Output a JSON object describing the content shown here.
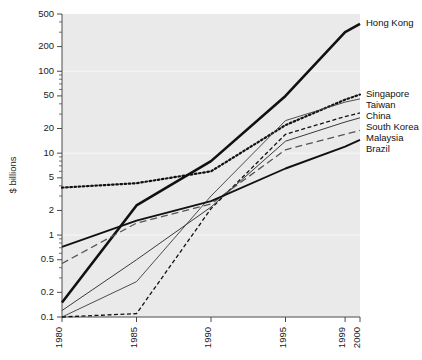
{
  "chart_data": {
    "type": "line",
    "title": "",
    "subtitle": "",
    "xlabel": "",
    "ylabel": "$ billions",
    "xscale": "linear",
    "yscale": "log",
    "xlim": [
      1980,
      2000
    ],
    "ylim": [
      0.1,
      500
    ],
    "grid": true,
    "legend_position": "right-inline",
    "x_ticks": [
      1980,
      1985,
      1990,
      1995,
      1999,
      2000
    ],
    "x_tick_labels": [
      "1980",
      "1985",
      "1990",
      "1995",
      "1999",
      "2000"
    ],
    "y_ticks": [
      0.1,
      0.2,
      0.5,
      1,
      2,
      5,
      10,
      20,
      50,
      100,
      200,
      500
    ],
    "y_tick_labels": [
      "0.1",
      "0.2",
      "0.5",
      "1",
      "2",
      "5",
      "10",
      "20",
      "50",
      "100",
      "200",
      "500"
    ],
    "x": [
      1980,
      1985,
      1990,
      1995,
      1999,
      2000
    ],
    "series": [
      {
        "name": "Hong Kong",
        "style": "solid",
        "width": 2.6,
        "color": "#111111",
        "values": [
          0.15,
          2.3,
          8.0,
          50.0,
          300.0,
          380.0
        ]
      },
      {
        "name": "Singapore",
        "style": "dotted",
        "width": 2.2,
        "color": "#111111",
        "values": [
          3.8,
          4.3,
          6.0,
          22.0,
          45.0,
          52.0
        ]
      },
      {
        "name": "Taiwan",
        "style": "solid",
        "width": 0.9,
        "color": "#3a3a3a",
        "values": [
          0.1,
          0.27,
          3.0,
          25.0,
          42.0,
          46.0
        ]
      },
      {
        "name": "China",
        "style": "dashed",
        "width": 1.3,
        "color": "#111111",
        "values": [
          0.1,
          0.11,
          2.1,
          17.0,
          28.0,
          31.0
        ]
      },
      {
        "name": "South Korea",
        "style": "solid",
        "width": 1.0,
        "color": "#3a3a3a",
        "values": [
          0.12,
          0.5,
          2.2,
          14.0,
          24.0,
          27.0
        ]
      },
      {
        "name": "Malaysia",
        "style": "longdash",
        "width": 1.3,
        "color": "#555555",
        "values": [
          0.45,
          1.4,
          2.4,
          11.0,
          17.0,
          19.0
        ]
      },
      {
        "name": "Brazil",
        "style": "solid",
        "width": 1.9,
        "color": "#111111",
        "values": [
          0.72,
          1.5,
          2.6,
          6.5,
          12.0,
          14.5
        ]
      }
    ]
  },
  "axis": {
    "y_title": "$ billions"
  },
  "colors": {
    "plot_background": "#eaeaea",
    "page_background": "#ffffff",
    "axis": "#4a4a4a",
    "gridline": "#f7f7f7",
    "text": "#1b1b1b"
  }
}
